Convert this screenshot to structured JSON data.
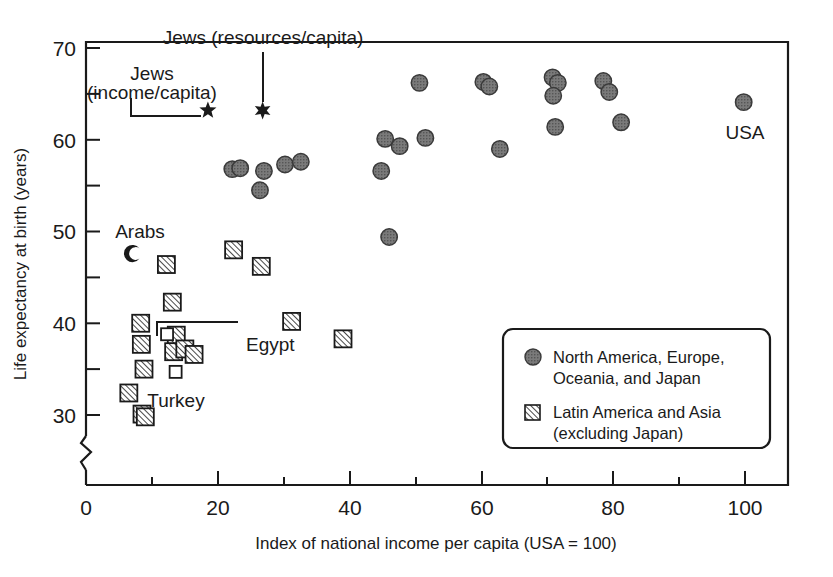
{
  "chart_data": {
    "type": "scatter",
    "title": "",
    "xlabel": "Index of national income per capita (USA = 100)",
    "ylabel": "Life expectancy at birth (years)",
    "xlim": [
      0,
      106
    ],
    "ylim": [
      28,
      72
    ],
    "grid": false,
    "axis_break_y": true,
    "xticks": [
      0,
      20,
      40,
      60,
      80,
      100
    ],
    "xticks_minor": [
      10,
      30,
      50,
      70,
      90
    ],
    "yticks": [
      30,
      40,
      50,
      60,
      70
    ],
    "yticks_minor": [
      35,
      45,
      55,
      65
    ],
    "legend_position": "lower-right",
    "series": [
      {
        "name": "North America, Europe, Oceania, and Japan",
        "marker": "filled-circle",
        "color": "#808080",
        "points": [
          {
            "x": 22.2,
            "y": 56.8
          },
          {
            "x": 23.4,
            "y": 56.9
          },
          {
            "x": 27.0,
            "y": 56.6
          },
          {
            "x": 26.4,
            "y": 54.5
          },
          {
            "x": 30.2,
            "y": 57.3
          },
          {
            "x": 32.6,
            "y": 57.6
          },
          {
            "x": 44.8,
            "y": 56.6
          },
          {
            "x": 45.4,
            "y": 60.1
          },
          {
            "x": 47.6,
            "y": 59.3
          },
          {
            "x": 46.0,
            "y": 49.4
          },
          {
            "x": 50.6,
            "y": 66.2
          },
          {
            "x": 51.5,
            "y": 60.2
          },
          {
            "x": 60.3,
            "y": 66.3
          },
          {
            "x": 61.2,
            "y": 65.8
          },
          {
            "x": 62.8,
            "y": 59.0
          },
          {
            "x": 70.8,
            "y": 66.8
          },
          {
            "x": 71.6,
            "y": 66.2
          },
          {
            "x": 70.9,
            "y": 64.8
          },
          {
            "x": 71.2,
            "y": 61.4
          },
          {
            "x": 78.5,
            "y": 66.4
          },
          {
            "x": 79.4,
            "y": 65.2
          },
          {
            "x": 81.2,
            "y": 61.9
          },
          {
            "x": 99.8,
            "y": 64.1
          }
        ]
      },
      {
        "name": "Latin America and Asia (excluding Japan)",
        "marker": "hatched-square",
        "color": "#ffffff",
        "points": [
          {
            "x": 12.2,
            "y": 46.4
          },
          {
            "x": 22.4,
            "y": 48.0
          },
          {
            "x": 26.6,
            "y": 46.2
          },
          {
            "x": 13.1,
            "y": 42.3
          },
          {
            "x": 8.3,
            "y": 40.0
          },
          {
            "x": 31.2,
            "y": 40.2
          },
          {
            "x": 39.0,
            "y": 38.3
          },
          {
            "x": 13.7,
            "y": 38.7
          },
          {
            "x": 8.4,
            "y": 37.7
          },
          {
            "x": 13.3,
            "y": 36.9
          },
          {
            "x": 15.0,
            "y": 37.2
          },
          {
            "x": 16.4,
            "y": 36.6
          },
          {
            "x": 8.8,
            "y": 35.0
          },
          {
            "x": 6.5,
            "y": 32.4
          },
          {
            "x": 8.5,
            "y": 30.1
          },
          {
            "x": 9.0,
            "y": 29.8
          }
        ]
      },
      {
        "name": "Turkey",
        "marker": "open-square",
        "color": "#ffffff",
        "points": [
          {
            "x": 13.6,
            "y": 34.7
          }
        ]
      },
      {
        "name": "Egypt",
        "marker": "open-square",
        "color": "#ffffff",
        "points": [
          {
            "x": 12.3,
            "y": 38.8
          }
        ]
      },
      {
        "name": "Arabs",
        "marker": "crescent",
        "color": "#1a1a1a",
        "points": [
          {
            "x": 7.0,
            "y": 47.6
          }
        ]
      },
      {
        "name": "Jews (income/capita)",
        "marker": "star-5",
        "color": "#1a1a1a",
        "points": [
          {
            "x": 18.5,
            "y": 63.2
          }
        ]
      },
      {
        "name": "Jews (resources/capita)",
        "marker": "star-6",
        "color": "#1a1a1a",
        "points": [
          {
            "x": 26.8,
            "y": 63.2
          }
        ]
      }
    ],
    "annotations": [
      {
        "text": "Jews (resources/capita)",
        "anchor_x": 26.8,
        "anchor_y": 63.2
      },
      {
        "text": "Jews",
        "anchor_x": 18.5,
        "anchor_y": 63.2
      },
      {
        "text": "(income/capita)",
        "anchor_x": 18.5,
        "anchor_y": 63.2
      },
      {
        "text": "Arabs",
        "anchor_x": 7.0,
        "anchor_y": 47.6
      },
      {
        "text": "Egypt",
        "anchor_x": 12.3,
        "anchor_y": 38.8
      },
      {
        "text": "Turkey",
        "anchor_x": 13.6,
        "anchor_y": 34.7
      },
      {
        "text": "USA",
        "anchor_x": 99.8,
        "anchor_y": 64.1
      }
    ]
  },
  "axes": {
    "x_title": "Index of national income per capita (USA = 100)",
    "y_title": "Life expectancy at birth (years)",
    "x_tick_labels": [
      "0",
      "20",
      "40",
      "60",
      "80",
      "100"
    ],
    "y_tick_labels": [
      "30",
      "40",
      "50",
      "60",
      "70"
    ]
  },
  "annotations": {
    "jews_resources": "Jews (resources/capita)",
    "jews_income_line1": "Jews",
    "jews_income_line2": "(income/capita)",
    "arabs": "Arabs",
    "egypt": "Egypt",
    "turkey": "Turkey",
    "usa": "USA"
  },
  "legend": {
    "item1_line1": "North America, Europe,",
    "item1_line2": "Oceania, and Japan",
    "item2_line1": "Latin America and Asia",
    "item2_line2": "(excluding Japan)"
  },
  "colors": {
    "circle_fill": "#808080",
    "stroke": "#1a1a1a",
    "background": "#ffffff"
  }
}
